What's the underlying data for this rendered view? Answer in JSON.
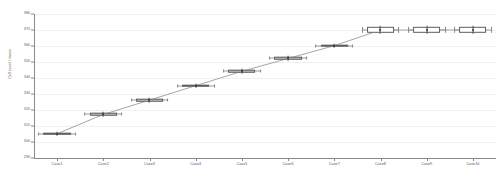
{
  "chart_data": {
    "type": "box",
    "title": "",
    "xlabel": "",
    "ylabel": "Cell count / mean",
    "ylim": [
      290,
      380
    ],
    "yticks": [
      380,
      370,
      360,
      350,
      340,
      330,
      320,
      310,
      300,
      290
    ],
    "grid": true,
    "legend": null,
    "categories": [
      "Case1",
      "Case2",
      "Case3",
      "Case4",
      "Case5",
      "Case6",
      "Case7",
      "Case8",
      "Case9",
      "Case10"
    ],
    "boxes": [
      {
        "category": "Case1",
        "lower_whisker": 303.0,
        "q1": 304.4,
        "median": 305.2,
        "q3": 306.0,
        "upper_whisker": 307.4,
        "mean": 305.2
      },
      {
        "category": "Case2",
        "lower_whisker": 315.0,
        "q1": 316.4,
        "median": 317.2,
        "q3": 318.0,
        "upper_whisker": 319.4,
        "mean": 317.2
      },
      {
        "category": "Case3",
        "lower_whisker": 324.0,
        "q1": 325.4,
        "median": 326.2,
        "q3": 327.0,
        "upper_whisker": 328.4,
        "mean": 326.2
      },
      {
        "category": "Case4",
        "lower_whisker": 333.0,
        "q1": 334.4,
        "median": 335.2,
        "q3": 336.0,
        "upper_whisker": 337.4,
        "mean": 335.2
      },
      {
        "category": "Case5",
        "lower_whisker": 342.0,
        "q1": 343.4,
        "median": 344.2,
        "q3": 345.0,
        "upper_whisker": 346.4,
        "mean": 344.2
      },
      {
        "category": "Case6",
        "lower_whisker": 350.0,
        "q1": 351.4,
        "median": 352.2,
        "q3": 353.0,
        "upper_whisker": 354.4,
        "mean": 352.2
      },
      {
        "category": "Case7",
        "lower_whisker": 358.0,
        "q1": 359.4,
        "median": 360.2,
        "q3": 361.0,
        "upper_whisker": 362.4,
        "mean": 360.2
      },
      {
        "category": "Case8",
        "lower_whisker": 366.0,
        "q1": 368.0,
        "median": 370.0,
        "q3": 372.0,
        "upper_whisker": 374.0,
        "mean": 370.0
      },
      {
        "category": "Case9",
        "lower_whisker": 366.0,
        "q1": 368.0,
        "median": 370.0,
        "q3": 372.0,
        "upper_whisker": 374.0,
        "mean": 370.0
      },
      {
        "category": "Case10",
        "lower_whisker": 366.0,
        "q1": 368.0,
        "median": 370.0,
        "q3": 372.0,
        "upper_whisker": 374.0,
        "mean": 370.0
      }
    ],
    "trend_line": {
      "name": "mean trend",
      "values": [
        305.2,
        317.2,
        326.2,
        335.2,
        344.2,
        352.2,
        360.2,
        370.0,
        370.0,
        370.0
      ],
      "color": "#8f8f8f"
    },
    "colors": {
      "box_fill": "#c9c9c9",
      "box_fill_open": "#ffffff",
      "box_edge": "#5e5e5e",
      "whisker": "#9a9a9a",
      "marker": "#3a3a3a",
      "grid": "#f0f0f0",
      "axis": "#8a8a8a",
      "background": "#ffffff",
      "tick_label": "#5a5a5a"
    }
  }
}
